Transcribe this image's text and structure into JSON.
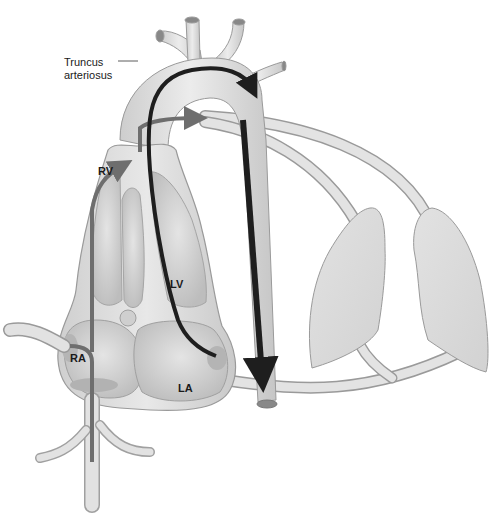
{
  "diagram": {
    "title": "Truncus arteriosus",
    "labels": {
      "truncus": "Truncus\narteriosus",
      "truncus_line1": "Truncus",
      "truncus_line2": "arteriosus",
      "rv": "RV",
      "lv": "LV",
      "ra": "RA",
      "la": "LA"
    },
    "structures": [
      "heart",
      "truncus-arteriosus",
      "aortic-arch",
      "descending-aorta",
      "pulmonary-arteries",
      "pulmonary-veins",
      "right-lung",
      "left-lung",
      "vena-cava"
    ],
    "flow_arrows": [
      {
        "name": "systemic-venous-flow",
        "color": "#6e6e6e",
        "path": "IVC -> RA -> RV -> truncus -> pulmonary arteries"
      },
      {
        "name": "pulmonary-venous-flow",
        "color": "#1e1e1e",
        "path": "LA -> LV -> truncus -> aorta -> descending aorta"
      }
    ],
    "colors": {
      "tissue": "#d9d9d9",
      "tissue_light": "#e6e6e6",
      "outline": "#9a9a9a",
      "dark_arrow": "#1e1e1e",
      "gray_arrow": "#6e6e6e",
      "chamber_shadow": "#b8b8b8",
      "background": "#ffffff"
    }
  }
}
